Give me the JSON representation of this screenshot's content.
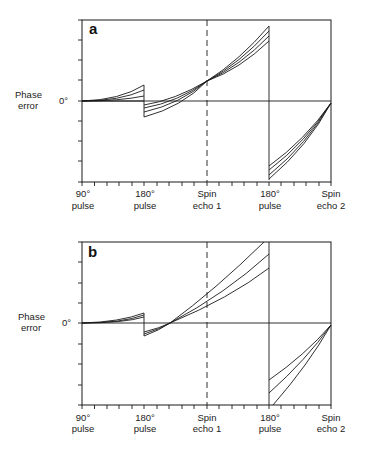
{
  "figure": {
    "panels": [
      {
        "id": "a",
        "label": "a",
        "y_label_line1": "Phase",
        "y_label_line2": "error",
        "zero_label": "0°",
        "x_labels": [
          {
            "line1": "90°",
            "line2": "pulse"
          },
          {
            "line1": "180°",
            "line2": "pulse"
          },
          {
            "line1": "Spin",
            "line2": "echo 1"
          },
          {
            "line1": "180°",
            "line2": "pulse"
          },
          {
            "line1": "Spin",
            "line2": "echo 2"
          }
        ],
        "description": "Phase error accumulation with curves diverging; phases converge at spin echo 1 and spin echo 2"
      },
      {
        "id": "b",
        "label": "b",
        "y_label_line1": "Phase",
        "y_label_line2": "error",
        "zero_label": "0°",
        "x_labels": [
          {
            "line1": "90°",
            "line2": "pulse"
          },
          {
            "line1": "180°",
            "line2": "pulse"
          },
          {
            "line1": "Spin",
            "line2": "echo 1"
          },
          {
            "line1": "180°",
            "line2": "pulse"
          },
          {
            "line1": "Spin",
            "line2": "echo 2"
          }
        ],
        "description": "Phase error curves converge before spin echo 1 and diverge at spin echo 1; converge at spin echo 2"
      }
    ],
    "colors": {
      "line": "#1a1a1a",
      "background": "#ffffff"
    }
  }
}
